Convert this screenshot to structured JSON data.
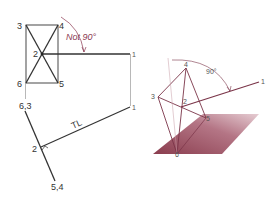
{
  "colors": {
    "ink": "#333333",
    "light_ink": "#777777",
    "accent": "#8b3a52",
    "plane_dark": "#8a3d4e",
    "plane_light": "#d9b3bc",
    "right_lines": "#7a3448"
  },
  "left_view": {
    "point_labels": {
      "p3": "3",
      "p4": "4",
      "p2_top": "2",
      "p6": "6",
      "p5": "5",
      "p1_top": "1",
      "p63": "6,3",
      "p2_bottom": "2",
      "p1_bottom": "1",
      "p54": "5,4"
    },
    "angle_annotation": "Not 90°",
    "true_length_label": "TL"
  },
  "right_view": {
    "point_labels": {
      "p4": "4",
      "p3": "3",
      "p2": "2",
      "p5": "5",
      "p6": "6",
      "p1": "1"
    },
    "angle_annotation": "90°"
  }
}
